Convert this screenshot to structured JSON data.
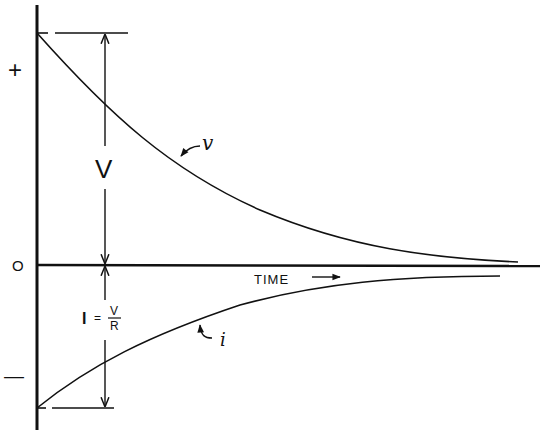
{
  "diagram": {
    "title": "",
    "axis_labels": {
      "plus": "+",
      "zero": "O",
      "minus": "—",
      "time": "TIME"
    },
    "dimension_labels": {
      "voltage": "V",
      "current_I": "I",
      "current_eq": "=",
      "current_num": "V",
      "current_den": "R"
    },
    "curve_labels": {
      "voltage_curve": "v",
      "current_curve": "i"
    },
    "colors": {
      "ink": "#111111",
      "background": "#ffffff"
    }
  }
}
